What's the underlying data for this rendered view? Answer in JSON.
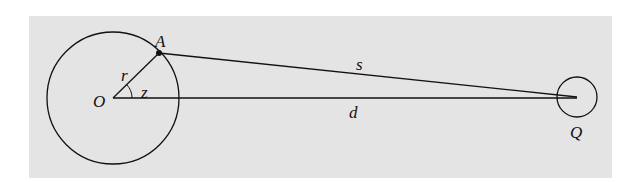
{
  "diagram": {
    "labels": {
      "point_A": "A",
      "radius": "r",
      "angle": "z",
      "center": "O",
      "segment_s": "s",
      "segment_d": "d",
      "point_Q": "Q"
    },
    "colors": {
      "background": "#e4e4e4",
      "stroke": "#111111"
    }
  }
}
